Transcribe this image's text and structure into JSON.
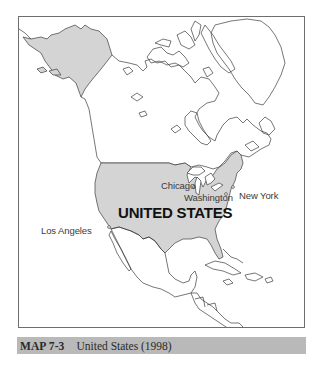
{
  "map": {
    "title": "North America",
    "highlight_country": "UNITED STATES",
    "highlight_fill": "#d4d4d4",
    "outline_color": "#3c3c3c",
    "labels": {
      "country": "UNITED STATES",
      "cities": [
        {
          "name": "Chicago"
        },
        {
          "name": "Washington"
        },
        {
          "name": "New York"
        },
        {
          "name": "Los Angeles"
        }
      ]
    }
  },
  "caption": {
    "number": "MAP 7-3",
    "title": "United States (1998)"
  }
}
